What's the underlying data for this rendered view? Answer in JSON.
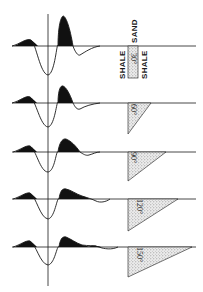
{
  "figure": {
    "panels": [
      {
        "label": "30°",
        "shape": "rectangle",
        "baseline_y": 46
      },
      {
        "label": "60°",
        "shape": "wedge",
        "baseline_y": 103
      },
      {
        "label": "90°",
        "shape": "wedge",
        "baseline_y": 152
      },
      {
        "label": "120°",
        "shape": "wedge",
        "baseline_y": 199
      },
      {
        "label": "150°",
        "shape": "wedge",
        "baseline_y": 247
      }
    ],
    "labels": {
      "shale_left": "SHALE",
      "sand": "SAND",
      "shale_right": "SHALE",
      "angle_30": "30°",
      "angle_60": "60°",
      "angle_90": "90°",
      "angle_120": "120°",
      "angle_150": "150°"
    },
    "colors": {
      "ink": "#1a1a1a",
      "fill": "#111111",
      "stipple": "#bdbdbd",
      "background": "#ffffff"
    }
  }
}
